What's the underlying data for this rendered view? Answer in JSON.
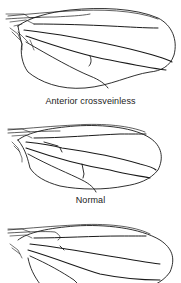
{
  "figure": {
    "panels": [
      {
        "id": "wing-1",
        "caption": "Anterior crossveinless",
        "variant": "anterior-crossveinless"
      },
      {
        "id": "wing-2",
        "caption": "Normal",
        "variant": "normal"
      },
      {
        "id": "wing-3",
        "caption": "",
        "variant": "partial-wing"
      }
    ]
  },
  "colors": {
    "line": "#1a1a1a",
    "background": "#ffffff",
    "caption": "#222222"
  }
}
